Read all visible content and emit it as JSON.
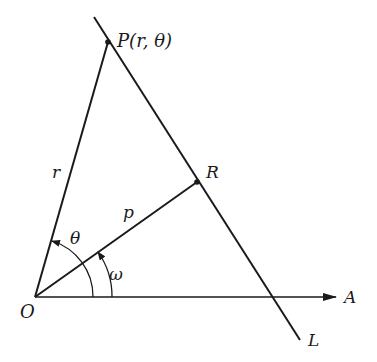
{
  "diagram": {
    "type": "geometry",
    "colors": {
      "stroke": "#1a1a1a",
      "background": "#ffffff"
    },
    "points": {
      "O": {
        "label": "O",
        "x": 35,
        "y": 297
      },
      "P": {
        "label": "P(r, θ)",
        "x": 108,
        "y": 42
      },
      "R": {
        "label": "R",
        "x": 197,
        "y": 182
      },
      "A": {
        "label": "A",
        "x": 338,
        "y": 297
      },
      "L": {
        "label": "L",
        "x": 305,
        "y": 340
      }
    },
    "segments": [
      {
        "name": "OP",
        "label": "r"
      },
      {
        "name": "OR",
        "label": "p"
      },
      {
        "name": "line-L",
        "label": "L"
      },
      {
        "name": "axis-OA",
        "label": "A"
      }
    ],
    "angles": [
      {
        "name": "theta",
        "label": "θ",
        "from": "OA",
        "to": "OP"
      },
      {
        "name": "omega",
        "label": "ω",
        "from": "OA",
        "to": "OR"
      }
    ],
    "labels": {
      "P": "P(r, θ)",
      "R": "R",
      "O": "O",
      "A": "A",
      "L": "L",
      "r": "r",
      "p": "p",
      "theta": "θ",
      "omega": "ω"
    }
  }
}
